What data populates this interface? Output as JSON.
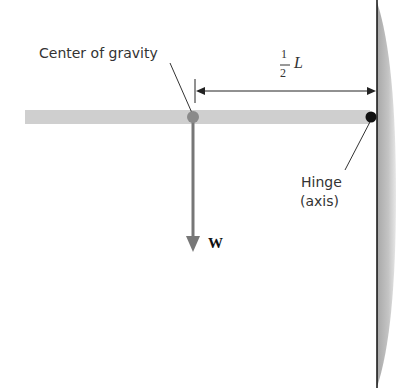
{
  "labels": {
    "center_of_gravity": "Center of gravity",
    "fraction_num": "1",
    "fraction_den": "2",
    "length_symbol": "L",
    "hinge_line1": "Hinge",
    "hinge_line2": "(axis)",
    "weight": "W"
  },
  "colors": {
    "rod": "#cfcfcf",
    "wall": "#b0b0b0",
    "arrow": "#777777",
    "cg_dot": "#8a8a8a",
    "hinge_dot": "#111111"
  }
}
